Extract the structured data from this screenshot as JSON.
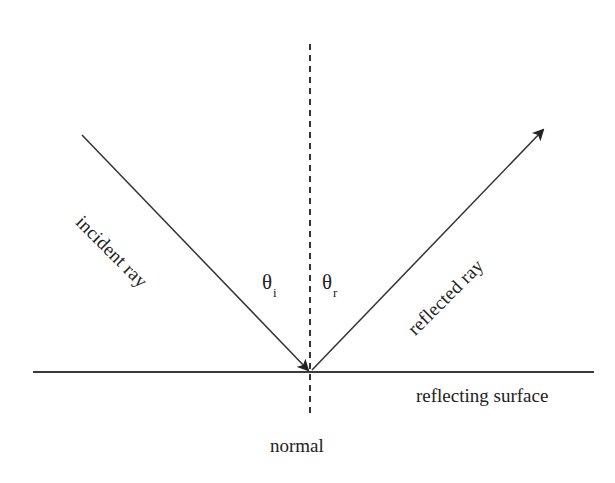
{
  "diagram": {
    "background_color": "#ffffff",
    "stroke_color": "#333333",
    "text_color": "#222222",
    "labels": {
      "incident_ray": "incident ray",
      "reflected_ray": "reflected ray",
      "theta_incidence_symbol": "θ",
      "theta_incidence_subscript": "i",
      "theta_reflection_symbol": "θ",
      "theta_reflection_subscript": "r",
      "reflecting_surface": "reflecting surface",
      "normal": "normal"
    },
    "geometry": {
      "origin_x": 310,
      "origin_y": 372,
      "incident_start_x": 82,
      "incident_start_y": 135,
      "reflected_end_x": 545,
      "reflected_end_y": 128,
      "surface_left_x": 33,
      "surface_right_x": 594,
      "surface_y": 372,
      "normal_top_y": 44,
      "normal_bottom_y": 418,
      "normal_x": 310,
      "incident_angle_deg": 45,
      "reflected_angle_deg": 45
    }
  }
}
